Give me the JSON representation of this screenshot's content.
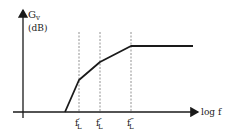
{
  "diagram": {
    "y_axis": {
      "symbol": "G",
      "subscript": "v",
      "unit": "(dB)"
    },
    "x_axis": {
      "label": "log f"
    },
    "break_frequencies": [
      {
        "base": "f",
        "prime": "′",
        "subscript": "L",
        "x": 79
      },
      {
        "base": "f",
        "prime": "″",
        "subscript": "L",
        "x": 100
      },
      {
        "base": "f",
        "prime": "‴",
        "subscript": "L",
        "x": 131
      }
    ],
    "curve_points": [
      [
        65,
        112
      ],
      [
        79,
        80
      ],
      [
        100,
        62
      ],
      [
        131,
        46
      ],
      [
        193,
        46
      ]
    ],
    "colors": {
      "line": "#1a1a1a",
      "dashed": "#777777"
    }
  }
}
